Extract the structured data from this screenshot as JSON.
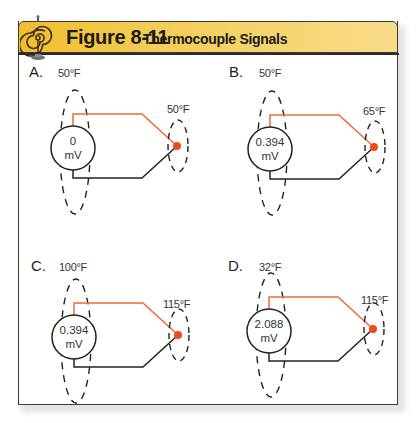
{
  "header": {
    "figure_number": "Figure 8-11",
    "title": "Thermocouple Signals",
    "icon": "spiral-coil-icon",
    "colors": {
      "bar_left": "#f1bd2c",
      "bar_right": "#f8dc8a",
      "border": "#3a3a3a"
    }
  },
  "colors": {
    "positive_wire": "#ee6a3a",
    "negative_wire": "#222222",
    "junction": "#f04a1a",
    "dashed_zone": "#222222"
  },
  "panels": [
    {
      "letter": "A.",
      "reference_temp": "50°F",
      "junction_temp": "65°F_placeholder",
      "meter_value": "0",
      "meter_unit": "mV"
    },
    {
      "letter": "B.",
      "reference_temp": "50°F",
      "junction_temp": "65°F",
      "meter_value": "0.394",
      "meter_unit": "mV"
    },
    {
      "letter": "C.",
      "reference_temp": "100°F",
      "junction_temp": "115°F",
      "meter_value": "0.394",
      "meter_unit": "mV"
    },
    {
      "letter": "D.",
      "reference_temp": "32°F",
      "junction_temp": "115°F",
      "meter_value": "2.088",
      "meter_unit": "mV"
    }
  ],
  "panel_a_junction_temp": "50°F"
}
